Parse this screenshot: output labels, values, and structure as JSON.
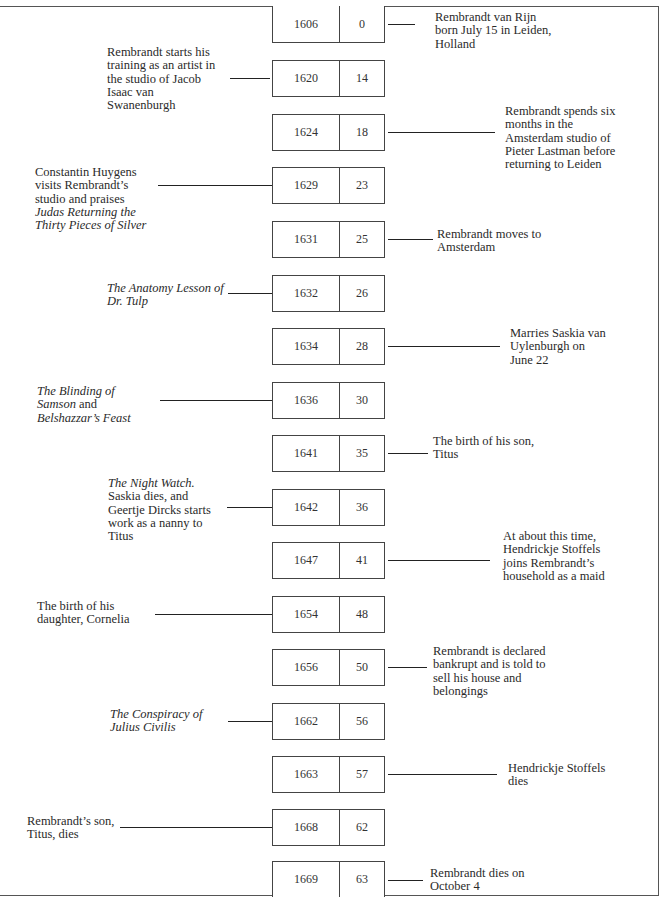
{
  "columns": [
    "Year",
    "Age"
  ],
  "colors": {
    "line": "#222222",
    "border": "#444444",
    "text": "#2a2a2a",
    "background": "#ffffff"
  },
  "events": [
    {
      "year": "1606",
      "age": "0",
      "side": "right",
      "text": "Rembrandt van Rijn born July 15 in Leiden, Holland",
      "lines": [
        {
          "t": "Rembrandt van Rijn"
        },
        {
          "t": "born July 15 in Leiden,"
        },
        {
          "t": "Holland"
        }
      ]
    },
    {
      "year": "1620",
      "age": "14",
      "side": "left",
      "text": "Rembrandt starts his training as an artist in the studio of Jacob Isaac van Swanenburgh",
      "lines": [
        {
          "t": "Rembrandt starts his"
        },
        {
          "t": "training as an artist in"
        },
        {
          "t": "the studio of Jacob"
        },
        {
          "t": "Isaac van"
        },
        {
          "t": "Swanenburgh"
        }
      ]
    },
    {
      "year": "1624",
      "age": "18",
      "side": "right",
      "text": "Rembrandt spends six months in the Amsterdam studio of Pieter Lastman before returning to Leiden",
      "lines": [
        {
          "t": "Rembrandt spends six"
        },
        {
          "t": "months in the"
        },
        {
          "t": "Amsterdam studio of"
        },
        {
          "t": "Pieter Lastman before"
        },
        {
          "t": "returning to Leiden"
        }
      ]
    },
    {
      "year": "1629",
      "age": "23",
      "side": "left",
      "text": "Constantin Huygens visits Rembrandt's studio and praises Judas Returning the Thirty Pieces of Silver",
      "lines": [
        {
          "t": "Constantin Huygens"
        },
        {
          "t": "visits Rembrandt’s"
        },
        {
          "t": "studio and praises"
        },
        {
          "t": "Judas Returning the",
          "i": true
        },
        {
          "t": "Thirty Pieces of Silver",
          "i": true
        }
      ]
    },
    {
      "year": "1631",
      "age": "25",
      "side": "right",
      "text": "Rembrandt moves to Amsterdam",
      "lines": [
        {
          "t": "Rembrandt moves to"
        },
        {
          "t": "Amsterdam"
        }
      ]
    },
    {
      "year": "1632",
      "age": "26",
      "side": "left",
      "text": "The Anatomy Lesson of Dr. Tulp",
      "lines": [
        {
          "t": "The Anatomy Lesson of",
          "i": true
        },
        {
          "t": "Dr. Tulp",
          "i": true
        }
      ]
    },
    {
      "year": "1634",
      "age": "28",
      "side": "right",
      "text": "Marries Saskia van Uylenburgh on June 22",
      "lines": [
        {
          "t": "Marries Saskia van"
        },
        {
          "t": "Uylenburgh on"
        },
        {
          "t": "June 22"
        }
      ]
    },
    {
      "year": "1636",
      "age": "30",
      "side": "left",
      "text": "The Blinding of Samson and Belshazzar's Feast",
      "lines": [
        {
          "t": "The Blinding of",
          "i": true
        },
        {
          "parts": [
            {
              "t": "Samson",
              "i": true
            },
            {
              "t": " and"
            }
          ]
        },
        {
          "t": "Belshazzar’s Feast",
          "i": true
        }
      ]
    },
    {
      "year": "1641",
      "age": "35",
      "side": "right",
      "text": "The birth of his son, Titus",
      "lines": [
        {
          "t": "The birth of his son,"
        },
        {
          "t": "Titus"
        }
      ]
    },
    {
      "year": "1642",
      "age": "36",
      "side": "left",
      "text": "The Night Watch. Saskia dies, and Geertje Dircks starts work as a nanny to Titus",
      "lines": [
        {
          "t": "The Night Watch.",
          "i": true
        },
        {
          "t": "Saskia dies, and"
        },
        {
          "t": "Geertje Dircks starts"
        },
        {
          "t": "work as a nanny to"
        },
        {
          "t": "Titus"
        }
      ]
    },
    {
      "year": "1647",
      "age": "41",
      "side": "right",
      "text": "At about this time, Hendrickje Stoffels joins Rembrandt's household as a maid",
      "lines": [
        {
          "t": "At about this time,"
        },
        {
          "t": "Hendrickje Stoffels"
        },
        {
          "t": "joins Rembrandt’s"
        },
        {
          "t": "household as a maid"
        }
      ]
    },
    {
      "year": "1654",
      "age": "48",
      "side": "left",
      "text": "The birth of his daughter, Cornelia",
      "lines": [
        {
          "t": "The birth of his"
        },
        {
          "t": "daughter, Cornelia"
        }
      ]
    },
    {
      "year": "1656",
      "age": "50",
      "side": "right",
      "text": "Rembrandt is declared bankrupt and is told to sell his house and belongings",
      "lines": [
        {
          "t": "Rembrandt is declared"
        },
        {
          "t": "bankrupt and is told to"
        },
        {
          "t": "sell his house and"
        },
        {
          "t": "belongings"
        }
      ]
    },
    {
      "year": "1662",
      "age": "56",
      "side": "left",
      "text": "The Conspiracy of Julius Civilis",
      "lines": [
        {
          "t": "The Conspiracy of",
          "i": true
        },
        {
          "t": "Julius Civilis",
          "i": true
        }
      ]
    },
    {
      "year": "1663",
      "age": "57",
      "side": "right",
      "text": "Hendrickje Stoffels dies",
      "lines": [
        {
          "t": "Hendrickje Stoffels"
        },
        {
          "t": "dies"
        }
      ]
    },
    {
      "year": "1668",
      "age": "62",
      "side": "left",
      "text": "Rembrandt's son, Titus, dies",
      "lines": [
        {
          "t": "Rembrandt’s son,"
        },
        {
          "t": "Titus, dies"
        }
      ]
    },
    {
      "year": "1669",
      "age": "63",
      "side": "right",
      "text": "Rembrandt dies on October 4",
      "lines": [
        {
          "t": "Rembrandt dies on"
        },
        {
          "t": "October 4"
        }
      ]
    }
  ],
  "layout": [
    {
      "boxTop": 6,
      "line": [
        388,
        415
      ],
      "textX": 435,
      "textTop": 11
    },
    {
      "boxTop": 60,
      "line": [
        230,
        270
      ],
      "textX": 107,
      "textTop": 46
    },
    {
      "boxTop": 114,
      "line": [
        388,
        495
      ],
      "textX": 505,
      "textTop": 105
    },
    {
      "boxTop": 167,
      "line": [
        158,
        272
      ],
      "textX": 35,
      "textTop": 166
    },
    {
      "boxTop": 221,
      "line": [
        388,
        433
      ],
      "textX": 437,
      "textTop": 228
    },
    {
      "boxTop": 275,
      "line": [
        228,
        272
      ],
      "textX": 107,
      "textTop": 282
    },
    {
      "boxTop": 328,
      "line": [
        388,
        500
      ],
      "textX": 510,
      "textTop": 327
    },
    {
      "boxTop": 382,
      "line": [
        160,
        272
      ],
      "textX": 37,
      "textTop": 385
    },
    {
      "boxTop": 435,
      "line": [
        388,
        428
      ],
      "textX": 433,
      "textTop": 435
    },
    {
      "boxTop": 489,
      "line": [
        227,
        272
      ],
      "textX": 108,
      "textTop": 477
    },
    {
      "boxTop": 542,
      "line": [
        388,
        490
      ],
      "textX": 503,
      "textTop": 530
    },
    {
      "boxTop": 596,
      "line": [
        155,
        272
      ],
      "textX": 37,
      "textTop": 600
    },
    {
      "boxTop": 649,
      "line": [
        388,
        427
      ],
      "textX": 433,
      "textTop": 645
    },
    {
      "boxTop": 703,
      "line": [
        228,
        272
      ],
      "textX": 110,
      "textTop": 708
    },
    {
      "boxTop": 756,
      "line": [
        388,
        497
      ],
      "textX": 508,
      "textTop": 762
    },
    {
      "boxTop": 809,
      "line": [
        120,
        272
      ],
      "textX": 27,
      "textTop": 815
    },
    {
      "boxTop": 861,
      "line": [
        388,
        423
      ],
      "textX": 430,
      "textTop": 867
    }
  ]
}
